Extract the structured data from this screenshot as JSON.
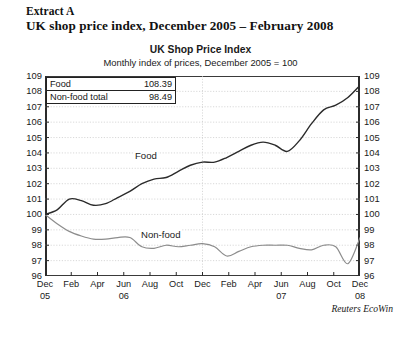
{
  "document": {
    "extract_label": "Extract A",
    "extract_title": "UK shop price index, December 2005 – February 2008"
  },
  "source": "Reuters EcoWin",
  "legend": {
    "rows": [
      {
        "name": "Food",
        "value": "108.39"
      },
      {
        "name": "Non-food total",
        "value": "98.49"
      }
    ]
  },
  "annotations": {
    "food": "Food",
    "nonfood": "Non-food"
  },
  "colors": {
    "food_line": "#2b2b2b",
    "nonfood_line": "#8c8c8c",
    "axis": "#2b2b2b",
    "grid": "#c9c9c9",
    "text": "#1a1a1a",
    "background": "#ffffff"
  },
  "chart_data": {
    "type": "line",
    "title": "UK Shop Price Index",
    "subtitle": "Monthly index of prices, December 2005 = 100",
    "xlabel": "",
    "ylabel": "",
    "ylim": [
      96,
      109
    ],
    "yticks": [
      96,
      97,
      98,
      99,
      100,
      101,
      102,
      103,
      104,
      105,
      106,
      107,
      108,
      109
    ],
    "ytick_labels": [
      "96",
      "97",
      "98",
      "99",
      "100",
      "101",
      "102",
      "103",
      "104",
      "105",
      "106",
      "107",
      "108",
      "109"
    ],
    "y_axis_both_sides": true,
    "grid": true,
    "grid_style": "dotted",
    "legend_position": "top-left-box",
    "x_tick_labels": [
      "Dec",
      "Feb",
      "Apr",
      "Jun",
      "Aug",
      "Oct",
      "Dec",
      "Feb",
      "Apr",
      "Jun",
      "Aug",
      "Oct",
      "Dec"
    ],
    "x_year_labels": [
      {
        "label": "05",
        "tick_index": 0
      },
      {
        "label": "06",
        "tick_index": 3
      },
      {
        "label": "07",
        "tick_index": 9
      },
      {
        "label": "08",
        "tick_index": 12
      }
    ],
    "x": [
      "2005-12",
      "2006-01",
      "2006-02",
      "2006-03",
      "2006-04",
      "2006-05",
      "2006-06",
      "2006-07",
      "2006-08",
      "2006-09",
      "2006-10",
      "2006-11",
      "2006-12",
      "2007-01",
      "2007-02",
      "2007-03",
      "2007-04",
      "2007-05",
      "2007-06",
      "2007-07",
      "2007-08",
      "2007-09",
      "2007-10",
      "2007-11",
      "2007-12",
      "2008-01",
      "2008-02"
    ],
    "series": [
      {
        "name": "Food",
        "color": "#2b2b2b",
        "final_value": 108.39,
        "values": [
          100.0,
          100.3,
          101.0,
          100.9,
          100.6,
          100.7,
          101.1,
          101.5,
          102.0,
          102.3,
          102.4,
          102.8,
          103.2,
          103.4,
          103.4,
          103.7,
          104.1,
          104.5,
          104.7,
          104.5,
          104.1,
          104.8,
          105.9,
          106.8,
          107.1,
          107.6,
          108.39
        ]
      },
      {
        "name": "Non-food",
        "color": "#8c8c8c",
        "final_value": 98.49,
        "values": [
          100.0,
          99.4,
          98.9,
          98.6,
          98.4,
          98.4,
          98.5,
          98.5,
          97.9,
          97.8,
          98.0,
          97.9,
          98.0,
          98.1,
          97.9,
          97.3,
          97.6,
          97.9,
          98.0,
          98.0,
          98.0,
          97.8,
          97.7,
          98.0,
          97.9,
          96.8,
          98.49
        ]
      }
    ]
  }
}
